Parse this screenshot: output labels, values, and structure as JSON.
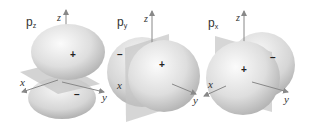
{
  "figure": {
    "orbitals": [
      {
        "name": "p_z",
        "label_main": "p",
        "label_sub": "z",
        "axes": {
          "vertical": "z",
          "left": "x",
          "right": "y"
        },
        "lobes": {
          "positive": "+",
          "negative": "–"
        }
      },
      {
        "name": "p_y",
        "label_main": "p",
        "label_sub": "y",
        "axes": {
          "vertical": "z",
          "left": "x",
          "right": "y"
        },
        "lobes": {
          "positive": "+",
          "negative": "–"
        }
      },
      {
        "name": "p_x",
        "label_main": "p",
        "label_sub": "x",
        "axes": {
          "vertical": "z",
          "left": "x",
          "right": "y"
        },
        "lobes": {
          "positive": "+",
          "negative": "–"
        }
      }
    ],
    "colors": {
      "lobe_light": "#f4f4f4",
      "lobe_dark": "#a9a9a9",
      "plane": "#bdbdbd",
      "axis": "#888888",
      "text": "#333333"
    }
  }
}
